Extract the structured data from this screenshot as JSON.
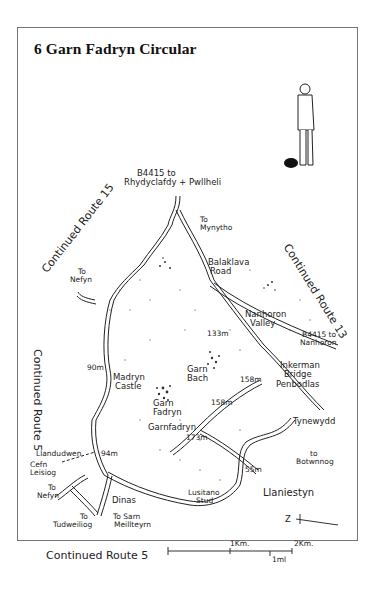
{
  "title": "6  Garn Fadryn Circular",
  "continuations": {
    "route15": "Continued Route 15",
    "route13": "Continued Route 13",
    "route5_side": "Continued Route 5",
    "route5_bottom": "Continued Route 5"
  },
  "roads": {
    "north": "B4415 to",
    "north2": "Rhydyclafdy + Pwllheli",
    "mynytho1": "To",
    "mynytho2": "Mynytho",
    "nefyn_top1": "To",
    "nefyn_top2": "Nefyn",
    "nanhoron1": "B4415 to",
    "nanhoron2": "Nanhoron",
    "botwnnog1": "to",
    "botwnnog2": "Botwnnog",
    "nefyn_bottom1": "To",
    "nefyn_bottom2": "Nefyn",
    "tudweiliog1": "To",
    "tudweiliog2": "Tudweiliog",
    "sarn1": "To Sarn",
    "sarn2": "Meillteyrn"
  },
  "places": {
    "balaklava1": "Balaklava",
    "balaklava2": "Road",
    "nanhoron_valley1": "Nanhoron",
    "nanhoron_valley2": "Valley",
    "inkerman1": "Inkerman",
    "inkerman2": "Bridge",
    "penbodlas": "Penbodlas",
    "madryn1": "Madryn",
    "madryn2": "Castle",
    "garn_bach1": "Garn",
    "garn_bach2": "Bach",
    "garn_fadryn1": "Garn",
    "garn_fadryn2": "Fadryn",
    "garnfadryn": "Garnfadryn",
    "tynewydd": "Tynewydd",
    "llandudwen": "Llandudwen",
    "cefn1": "Cefn",
    "cefn2": "Leisiog",
    "dinas": "Dinas",
    "lusitano1": "Lusitano",
    "lusitano2": "Stud",
    "llaniestyn": "Llaniestyn"
  },
  "heights": {
    "h133": "133m",
    "h158a": "158m",
    "h158b": "158m",
    "h173": "173m",
    "h90": "90m",
    "h94": "94m",
    "h55": "55m"
  },
  "scale": {
    "km1": "1Km.",
    "km2": "2Km.",
    "mile": "1ml"
  },
  "north_arrow": "Z"
}
